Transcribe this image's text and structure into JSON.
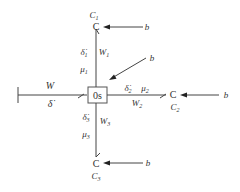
{
  "diagram": {
    "type": "bond-graph",
    "junction": {
      "label": "0s"
    },
    "input_bond": {
      "effort": "W",
      "flow": "δ̇"
    },
    "branches": [
      {
        "id": "top",
        "element": "C",
        "element_label": "C",
        "subscript": "1",
        "effort": "W",
        "effort_sub": "1",
        "flow": "δ̇",
        "flow_sub": "1",
        "param": "μ",
        "param_sub": "1",
        "source": "b"
      },
      {
        "id": "right",
        "element": "C",
        "element_label": "C",
        "subscript": "2",
        "effort": "W",
        "effort_sub": "2",
        "flow": "δ̇",
        "flow_sub": "2",
        "param": "μ",
        "param_sub": "2",
        "source": "b"
      },
      {
        "id": "bottom",
        "element": "C",
        "element_label": "C",
        "subscript": "3",
        "effort": "W",
        "effort_sub": "3",
        "flow": "δ̇",
        "flow_sub": "3",
        "param": "μ",
        "param_sub": "3",
        "source": "b"
      }
    ],
    "junction_source": "b",
    "colors": {
      "line": "#444444",
      "text": "#333333",
      "background": "#ffffff"
    }
  }
}
